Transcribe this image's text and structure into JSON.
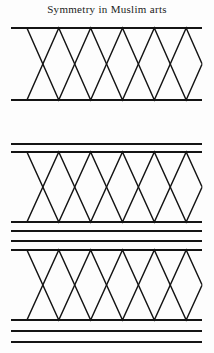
{
  "figure": {
    "title": "Symmetry in Muslim arts",
    "width": 214,
    "height": 353,
    "background_color": "#fdfdfd",
    "ink_color": "#141414",
    "geometry": {
      "left_x": 11,
      "right_x": 202,
      "zigzag_period": 63.7,
      "zigzag_half_period": 31.85,
      "apex_count_top": 6,
      "vertex_count_bottom": 5,
      "triangle_count": 6,
      "rule_stroke_width": 2.1,
      "zigzag_stroke_width": 1.45
    },
    "bands": [
      {
        "name": "band-1",
        "top_rules": [
          28
        ],
        "bottom_rules": [
          100
        ],
        "zigzag_top_y": 28,
        "zigzag_bottom_y": 100
      },
      {
        "name": "band-2",
        "top_rules": [
          144,
          152
        ],
        "bottom_rules": [
          222,
          231,
          241
        ],
        "zigzag_top_y": 152,
        "zigzag_bottom_y": 222
      },
      {
        "name": "band-3",
        "top_rules": [
          241,
          250
        ],
        "bottom_rules": [
          320,
          331,
          342
        ],
        "zigzag_top_y": 250,
        "zigzag_bottom_y": 320
      }
    ]
  },
  "chart_data": {
    "type": "line",
    "title": "Symmetry in Muslim arts",
    "xlabel": "",
    "ylabel": "",
    "xlim": [
      11,
      202
    ],
    "ylim": [
      28,
      342
    ],
    "grid": false,
    "legend": null,
    "series": [
      {
        "name": "band-1-zigzag",
        "x": [
          11,
          26.9,
          58.8,
          90.6,
          122.5,
          154.4,
          186.2,
          202
        ],
        "y": [
          100,
          28,
          100,
          28,
          100,
          28,
          100,
          60
        ]
      },
      {
        "name": "band-1-rules",
        "values": [
          28,
          100
        ]
      },
      {
        "name": "band-2-zigzag",
        "x": [
          11,
          26.9,
          58.8,
          90.6,
          122.5,
          154.4,
          186.2,
          202
        ],
        "y": [
          222,
          152,
          222,
          152,
          222,
          152,
          222,
          187
        ]
      },
      {
        "name": "band-2-rules",
        "values": [
          144,
          152,
          222,
          231,
          241
        ]
      },
      {
        "name": "band-3-zigzag",
        "x": [
          11,
          26.9,
          58.8,
          90.6,
          122.5,
          154.4,
          186.2,
          202
        ],
        "y": [
          320,
          250,
          320,
          250,
          320,
          250,
          320,
          285
        ]
      },
      {
        "name": "band-3-rules",
        "values": [
          241,
          250,
          320,
          331,
          342
        ]
      }
    ]
  }
}
